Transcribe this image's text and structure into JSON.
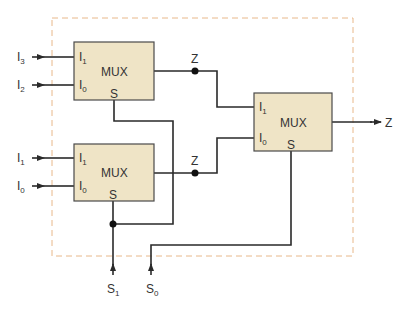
{
  "diagram": {
    "colors": {
      "box_fill": "#efe4c6",
      "box_stroke": "#4a4a4a",
      "wire": "#2a2a2a",
      "dashed_border": "#e8b88a"
    },
    "inputs": [
      {
        "name": "I",
        "sub": "3"
      },
      {
        "name": "I",
        "sub": "2"
      },
      {
        "name": "I",
        "sub": "1"
      },
      {
        "name": "I",
        "sub": "0"
      }
    ],
    "mux_top": {
      "label": "MUX",
      "in1": {
        "name": "I",
        "sub": "1"
      },
      "in0": {
        "name": "I",
        "sub": "0"
      },
      "sel": "S",
      "out": "Z"
    },
    "mux_bottom": {
      "label": "MUX",
      "in1": {
        "name": "I",
        "sub": "1"
      },
      "in0": {
        "name": "I",
        "sub": "0"
      },
      "sel": "S",
      "out": "Z"
    },
    "mux_right": {
      "label": "MUX",
      "in1": {
        "name": "I",
        "sub": "1"
      },
      "in0": {
        "name": "I",
        "sub": "0"
      },
      "sel": "S"
    },
    "output": "Z",
    "selects": [
      {
        "name": "S",
        "sub": "1"
      },
      {
        "name": "S",
        "sub": "0"
      }
    ]
  }
}
